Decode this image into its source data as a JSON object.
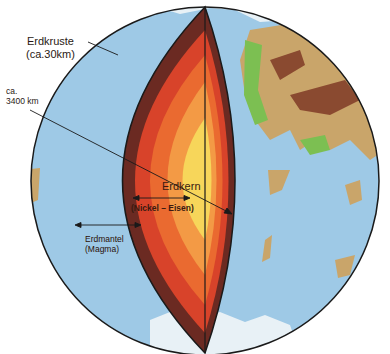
{
  "diagram": {
    "labels": {
      "crust": {
        "name": "Erdkruste",
        "detail": "(ca.30km)"
      },
      "radius": {
        "prefix": "ca.",
        "value": "3400 km"
      },
      "core": {
        "name": "Erdkern",
        "detail": "(Nickel – Eisen)"
      },
      "mantle": {
        "name": "Erdmantel",
        "detail": "(Magma)"
      }
    },
    "colors": {
      "ocean": "#9ec9e6",
      "land_green": "#7cbf52",
      "land_tan": "#c9a56a",
      "land_brown": "#8a4a30",
      "ice": "#e8f1f6",
      "crust_dark": "#6b2a22",
      "mantle_outer": "#d8432a",
      "mantle_mid": "#ea6a30",
      "mantle_inner": "#f39a45",
      "core": "#f7d65a",
      "outline": "#1a1a1a"
    }
  }
}
